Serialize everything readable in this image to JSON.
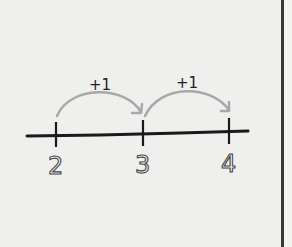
{
  "diagram": {
    "type": "number-line",
    "ticks": [
      {
        "value": "2",
        "x": 56
      },
      {
        "value": "3",
        "x": 143
      },
      {
        "value": "4",
        "x": 229
      }
    ],
    "jumps": [
      {
        "from": "2",
        "to": "3",
        "label": "+1"
      },
      {
        "from": "3",
        "to": "4",
        "label": "+1"
      }
    ],
    "colors": {
      "line": "#1a1a1a",
      "arrow": "#a8a8a8",
      "background": "#efefed",
      "border": "#3a3a3a"
    }
  }
}
